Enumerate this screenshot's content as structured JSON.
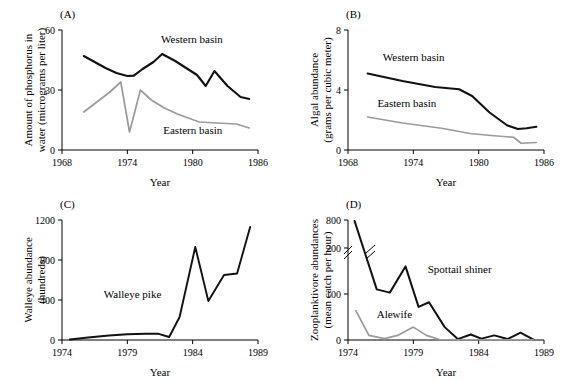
{
  "figure": {
    "panels": [
      {
        "key": "A",
        "label": "(A)",
        "xlabel": "Year",
        "ylabel_lines": [
          "Amount of phosphorus in",
          "water (micrograms per liter)"
        ],
        "xticks": [
          1968,
          1974,
          1980,
          1986
        ],
        "yticks": [
          0,
          30,
          60
        ],
        "xlim": [
          1968,
          1986
        ],
        "ylim": [
          0,
          60
        ],
        "broken_axis": false,
        "series": [
          {
            "name": "Western basin",
            "color": "#111111",
            "width": 2.1,
            "label_x": 1977.1,
            "label_y": 53.5,
            "x": [
              1970,
              1971,
              1972,
              1973,
              1974,
              1974.6,
              1975.4,
              1976.4,
              1977.2,
              1978.4,
              1979.4,
              1980.4,
              1981.2,
              1982.0,
              1983.2,
              1984.4,
              1985.2
            ],
            "y": [
              47.0,
              44.0,
              41.0,
              38.5,
              37.0,
              37.2,
              40.5,
              44.0,
              48.0,
              44.5,
              41.0,
              37.5,
              32.0,
              39.5,
              32.0,
              26.5,
              25.5
            ]
          },
          {
            "name": "Eastern basin",
            "color": "#9a9a9a",
            "width": 1.7,
            "label_x": 1977.3,
            "label_y": 8.0,
            "x": [
              1970,
              1971.2,
              1972.4,
              1973.4,
              1974.2,
              1975.2,
              1976.2,
              1977.4,
              1978.6,
              1979.6,
              1980.6,
              1982.2,
              1984.0,
              1985.2
            ],
            "y": [
              19.0,
              24.0,
              29.0,
              34.0,
              9.0,
              30.0,
              25.0,
              21.0,
              18.0,
              16.0,
              14.0,
              13.5,
              13.0,
              11.0
            ]
          }
        ]
      },
      {
        "key": "B",
        "label": "(B)",
        "xlabel": "Year",
        "ylabel_lines": [
          "Algal abundance",
          "(grams per cubic meter)"
        ],
        "xticks": [
          1968,
          1974,
          1980,
          1986
        ],
        "yticks": [
          0,
          4,
          8
        ],
        "xlim": [
          1968,
          1986
        ],
        "ylim": [
          0,
          8
        ],
        "broken_axis": false,
        "series": [
          {
            "name": "Western basin",
            "color": "#111111",
            "width": 2.1,
            "label_x": 1971.2,
            "label_y": 5.95,
            "x": [
              1969.8,
              1973.0,
              1976.0,
              1978.2,
              1979.4,
              1981.0,
              1982.6,
              1983.6,
              1984.4,
              1985.3
            ],
            "y": [
              5.1,
              4.6,
              4.2,
              4.05,
              3.6,
              2.5,
              1.65,
              1.4,
              1.45,
              1.55
            ]
          },
          {
            "name": "Eastern basin",
            "color": "#9a9a9a",
            "width": 1.7,
            "label_x": 1970.7,
            "label_y": 2.85,
            "x": [
              1969.8,
              1973.0,
              1976.6,
              1979.2,
              1981.4,
              1983.2,
              1983.9,
              1985.3
            ],
            "y": [
              2.2,
              1.8,
              1.45,
              1.1,
              0.95,
              0.85,
              0.45,
              0.5
            ]
          }
        ]
      },
      {
        "key": "C",
        "label": "(C)",
        "xlabel": "Year",
        "ylabel_lines": [
          "Walleye abundance",
          "(hundreds)"
        ],
        "xticks": [
          1974,
          1979,
          1984,
          1989
        ],
        "yticks": [
          0,
          400,
          800,
          1200
        ],
        "xlim": [
          1974,
          1989
        ],
        "ylim": [
          0,
          1200
        ],
        "broken_axis": false,
        "series": [
          {
            "name": "Walleye pike",
            "color": "#111111",
            "width": 1.9,
            "label_x": 1977.2,
            "label_y": 420,
            "x": [
              1974.6,
              1976.0,
              1977.6,
              1979.0,
              1980.4,
              1981.4,
              1982.2,
              1983.0,
              1984.2,
              1985.2,
              1986.4,
              1987.4,
              1988.4
            ],
            "y": [
              5,
              25,
              45,
              58,
              62,
              62,
              30,
              230,
              930,
              390,
              650,
              665,
              1130
            ]
          }
        ]
      },
      {
        "key": "D",
        "label": "(D)",
        "xlabel": "Year",
        "ylabel_lines": [
          "Zooplanktivore abundances",
          "(mean catch per hour)"
        ],
        "xticks": [
          1974,
          1979,
          1984,
          1989
        ],
        "yticks": [
          0,
          100,
          200,
          800
        ],
        "xlim": [
          1974,
          1989
        ],
        "ylim": [
          0,
          800
        ],
        "broken_axis": true,
        "break_below": 200,
        "break_above": 800,
        "series": [
          {
            "name": "Spottail shiner",
            "color": "#111111",
            "width": 2.0,
            "label_x": 1980.1,
            "label_y": 145,
            "x": [
              1974.5,
              1976.2,
              1977.2,
              1978.4,
              1979.4,
              1980.2,
              1981.4,
              1982.4,
              1983.4,
              1984.2,
              1985.2,
              1986.2,
              1987.2,
              1988.2
            ],
            "y": [
              780,
              110,
              103,
              160,
              72,
              82,
              28,
              2,
              12,
              3,
              10,
              2,
              16,
              1
            ]
          },
          {
            "name": "Alewife",
            "color": "#9a9a9a",
            "width": 1.7,
            "label_x": 1976.2,
            "label_y": 47,
            "x": [
              1974.6,
              1975.6,
              1976.8,
              1977.8,
              1979.0,
              1980.0,
              1981.0,
              1982.0,
              1984.0,
              1986.0,
              1988.2
            ],
            "y": [
              64,
              10,
              3,
              10,
              28,
              10,
              1,
              0.5,
              0.5,
              0.5,
              0.5
            ]
          }
        ]
      }
    ]
  }
}
